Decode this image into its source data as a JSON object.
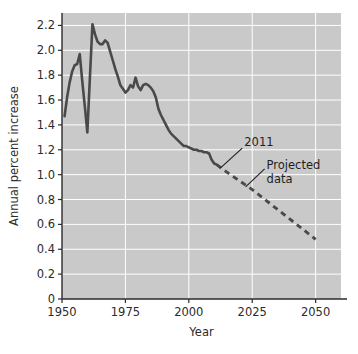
{
  "chart_data": {
    "type": "line",
    "title": "",
    "xlabel": "Year",
    "ylabel": "Annual percent increase",
    "xlim": [
      1950,
      2060
    ],
    "ylim": [
      0,
      2.3
    ],
    "xticks": [
      "1950",
      "1975",
      "2000",
      "2025",
      "2050"
    ],
    "xtick_values": [
      1950,
      1975,
      2000,
      2025,
      2050
    ],
    "yticks": [
      "0",
      "0.2",
      "0.4",
      "0.6",
      "0.8",
      "1.0",
      "1.2",
      "1.4",
      "1.6",
      "1.8",
      "2.0",
      "2.2"
    ],
    "ytick_values": [
      0,
      0.2,
      0.4,
      0.6,
      0.8,
      1.0,
      1.2,
      1.4,
      1.6,
      1.8,
      2.0,
      2.2
    ],
    "grid": true,
    "grid_color": "#ffffff",
    "plot_background": "#c9c9c9",
    "page_background": "#ffffff",
    "line_color": "#4a4a4a",
    "legend": "none",
    "series": [
      {
        "name": "Observed data",
        "style": "solid",
        "x": [
          1951,
          1952,
          1953,
          1954,
          1955,
          1956,
          1957,
          1958,
          1959,
          1960,
          1961,
          1962,
          1963,
          1964,
          1965,
          1966,
          1967,
          1968,
          1969,
          1970,
          1971,
          1972,
          1973,
          1974,
          1975,
          1976,
          1977,
          1978,
          1979,
          1980,
          1981,
          1982,
          1983,
          1984,
          1985,
          1986,
          1987,
          1988,
          1989,
          1990,
          1991,
          1992,
          1993,
          1994,
          1995,
          1996,
          1997,
          1998,
          1999,
          2000,
          2001,
          2002,
          2003,
          2004,
          2005,
          2006,
          2007,
          2008,
          2009,
          2010,
          2011
        ],
        "y": [
          1.47,
          1.62,
          1.74,
          1.83,
          1.88,
          1.89,
          1.97,
          1.75,
          1.55,
          1.34,
          1.78,
          2.21,
          2.13,
          2.07,
          2.05,
          2.05,
          2.08,
          2.06,
          1.99,
          1.92,
          1.85,
          1.79,
          1.72,
          1.69,
          1.66,
          1.68,
          1.72,
          1.7,
          1.78,
          1.71,
          1.68,
          1.72,
          1.73,
          1.72,
          1.7,
          1.67,
          1.62,
          1.53,
          1.48,
          1.44,
          1.4,
          1.36,
          1.33,
          1.31,
          1.29,
          1.27,
          1.25,
          1.23,
          1.23,
          1.22,
          1.21,
          1.2,
          1.2,
          1.19,
          1.19,
          1.18,
          1.18,
          1.17,
          1.12,
          1.09,
          1.08
        ]
      },
      {
        "name": "Projected data",
        "style": "dashed",
        "x": [
          2011,
          2015,
          2020,
          2025,
          2030,
          2035,
          2040,
          2045,
          2050
        ],
        "y": [
          1.08,
          1.02,
          0.95,
          0.88,
          0.8,
          0.72,
          0.64,
          0.56,
          0.48
        ]
      }
    ],
    "annotations": [
      {
        "text": "2011",
        "points_to_x": 2012,
        "points_to_y": 1.06
      },
      {
        "text": "Projected data",
        "line1": "Projected",
        "line2": "data",
        "points_to_x": 2022,
        "points_to_y": 0.91
      }
    ]
  },
  "axes": {
    "x_title": "Year",
    "y_title": "Annual percent increase"
  }
}
